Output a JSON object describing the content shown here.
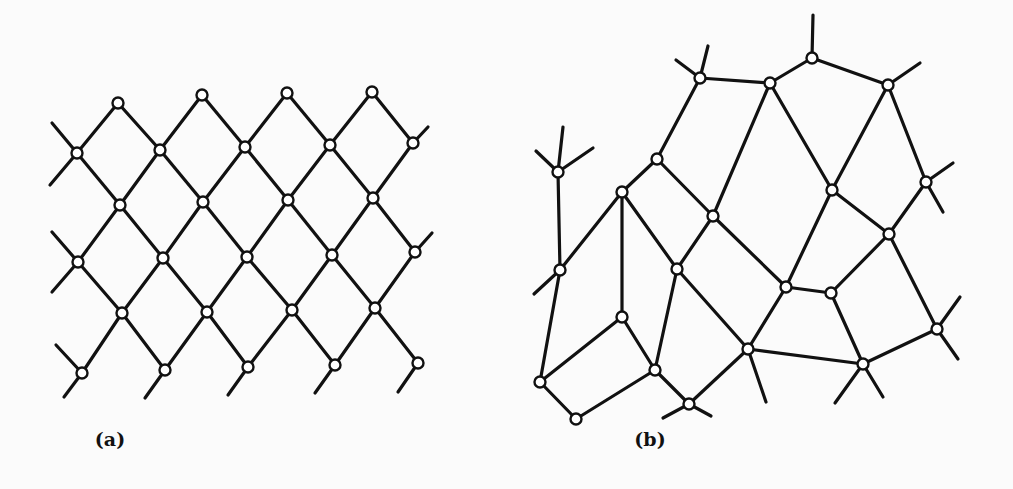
{
  "figure": {
    "panels": [
      {
        "id": "a",
        "label": "(a)",
        "label_pos": [
          110,
          446
        ],
        "description": "regular square lattice rotated 45 degrees",
        "nodes": [
          [
            118,
            103
          ],
          [
            202,
            95
          ],
          [
            287,
            93
          ],
          [
            372,
            92
          ],
          [
            77,
            153
          ],
          [
            160,
            150
          ],
          [
            245,
            147
          ],
          [
            330,
            145
          ],
          [
            413,
            143
          ],
          [
            120,
            205
          ],
          [
            203,
            202
          ],
          [
            288,
            200
          ],
          [
            373,
            198
          ],
          [
            78,
            262
          ],
          [
            163,
            258
          ],
          [
            247,
            257
          ],
          [
            332,
            255
          ],
          [
            415,
            252
          ],
          [
            122,
            313
          ],
          [
            207,
            312
          ],
          [
            292,
            310
          ],
          [
            375,
            308
          ],
          [
            82,
            373
          ],
          [
            165,
            370
          ],
          [
            248,
            367
          ],
          [
            335,
            365
          ],
          [
            418,
            363
          ]
        ],
        "edges": [
          [
            0,
            4
          ],
          [
            0,
            5
          ],
          [
            1,
            5
          ],
          [
            1,
            6
          ],
          [
            2,
            6
          ],
          [
            2,
            7
          ],
          [
            3,
            7
          ],
          [
            3,
            8
          ],
          [
            4,
            9
          ],
          [
            5,
            9
          ],
          [
            5,
            10
          ],
          [
            6,
            10
          ],
          [
            6,
            11
          ],
          [
            7,
            11
          ],
          [
            7,
            12
          ],
          [
            8,
            12
          ],
          [
            9,
            13
          ],
          [
            9,
            14
          ],
          [
            10,
            14
          ],
          [
            10,
            15
          ],
          [
            11,
            15
          ],
          [
            11,
            16
          ],
          [
            12,
            16
          ],
          [
            12,
            17
          ],
          [
            13,
            18
          ],
          [
            14,
            18
          ],
          [
            14,
            19
          ],
          [
            15,
            19
          ],
          [
            15,
            20
          ],
          [
            16,
            20
          ],
          [
            16,
            21
          ],
          [
            17,
            21
          ],
          [
            18,
            22
          ],
          [
            18,
            23
          ],
          [
            19,
            23
          ],
          [
            19,
            24
          ],
          [
            20,
            24
          ],
          [
            20,
            25
          ],
          [
            21,
            25
          ],
          [
            21,
            26
          ]
        ],
        "stubs": [
          [
            77,
            153,
            52,
            123
          ],
          [
            77,
            153,
            50,
            185
          ],
          [
            78,
            262,
            52,
            232
          ],
          [
            78,
            262,
            52,
            292
          ],
          [
            82,
            373,
            56,
            345
          ],
          [
            82,
            373,
            64,
            397
          ],
          [
            165,
            370,
            145,
            398
          ],
          [
            248,
            367,
            228,
            395
          ],
          [
            335,
            365,
            315,
            393
          ],
          [
            418,
            363,
            398,
            392
          ],
          [
            413,
            143,
            428,
            127
          ],
          [
            415,
            252,
            432,
            233
          ]
        ]
      },
      {
        "id": "b",
        "label": "(b)",
        "label_pos": [
          650,
          446
        ],
        "description": "irregular random network",
        "nodes": [
          [
            700,
            78
          ],
          [
            770,
            83
          ],
          [
            812,
            58
          ],
          [
            888,
            85
          ],
          [
            657,
            159
          ],
          [
            558,
            172
          ],
          [
            622,
            192
          ],
          [
            713,
            216
          ],
          [
            832,
            190
          ],
          [
            926,
            182
          ],
          [
            560,
            270
          ],
          [
            677,
            269
          ],
          [
            889,
            234
          ],
          [
            786,
            287
          ],
          [
            831,
            293
          ],
          [
            622,
            317
          ],
          [
            937,
            329
          ],
          [
            748,
            349
          ],
          [
            655,
            370
          ],
          [
            540,
            382
          ],
          [
            863,
            364
          ],
          [
            689,
            404
          ],
          [
            576,
            419
          ]
        ],
        "edges": [
          [
            0,
            1
          ],
          [
            0,
            4
          ],
          [
            1,
            2
          ],
          [
            2,
            3
          ],
          [
            1,
            7
          ],
          [
            1,
            8
          ],
          [
            3,
            8
          ],
          [
            3,
            9
          ],
          [
            4,
            6
          ],
          [
            4,
            7
          ],
          [
            5,
            10
          ],
          [
            6,
            10
          ],
          [
            6,
            15
          ],
          [
            6,
            11
          ],
          [
            7,
            11
          ],
          [
            7,
            13
          ],
          [
            8,
            13
          ],
          [
            9,
            12
          ],
          [
            8,
            12
          ],
          [
            12,
            14
          ],
          [
            12,
            16
          ],
          [
            13,
            14
          ],
          [
            13,
            17
          ],
          [
            14,
            20
          ],
          [
            11,
            17
          ],
          [
            11,
            18
          ],
          [
            15,
            18
          ],
          [
            15,
            19
          ],
          [
            10,
            19
          ],
          [
            17,
            21
          ],
          [
            18,
            21
          ],
          [
            17,
            20
          ],
          [
            16,
            20
          ],
          [
            19,
            22
          ],
          [
            22,
            18
          ]
        ],
        "stubs": [
          [
            700,
            78,
            676,
            60
          ],
          [
            700,
            78,
            708,
            46
          ],
          [
            812,
            58,
            813,
            15
          ],
          [
            888,
            85,
            920,
            63
          ],
          [
            926,
            182,
            953,
            163
          ],
          [
            926,
            182,
            943,
            212
          ],
          [
            558,
            172,
            536,
            151
          ],
          [
            558,
            172,
            563,
            127
          ],
          [
            558,
            172,
            593,
            148
          ],
          [
            560,
            270,
            534,
            294
          ],
          [
            937,
            329,
            960,
            297
          ],
          [
            937,
            329,
            958,
            359
          ],
          [
            863,
            364,
            835,
            403
          ],
          [
            863,
            364,
            883,
            397
          ],
          [
            748,
            349,
            766,
            402
          ],
          [
            689,
            404,
            663,
            418
          ],
          [
            689,
            404,
            711,
            416
          ]
        ]
      }
    ]
  }
}
